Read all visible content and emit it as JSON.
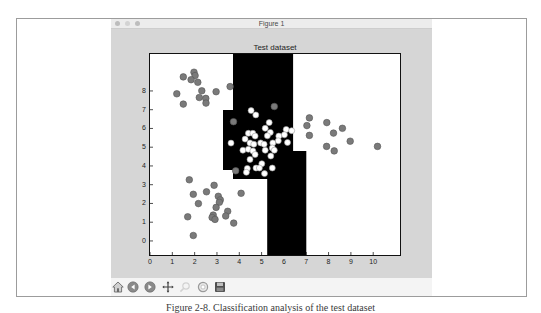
{
  "window": {
    "title": "Figure 1",
    "controls": [
      {
        "name": "close",
        "color": "#bdbdbd"
      },
      {
        "name": "minimize",
        "color": "#d3d3d3"
      },
      {
        "name": "zoom",
        "color": "#bdbdbd"
      }
    ],
    "canvas_color": "#d6d6d6"
  },
  "toolbar": {
    "buttons": [
      {
        "name": "home",
        "icon": "home-icon"
      },
      {
        "name": "back",
        "icon": "back-arrow-icon"
      },
      {
        "name": "forward",
        "icon": "forward-arrow-icon"
      },
      {
        "name": "pan",
        "icon": "pan-move-icon"
      },
      {
        "name": "zoom-to-rect",
        "icon": "zoom-magnifier-icon",
        "enabled": false
      },
      {
        "name": "configure-subplots",
        "icon": "subplots-icon"
      },
      {
        "name": "save",
        "icon": "save-icon"
      }
    ]
  },
  "caption": "Figure 2-8. Classification analysis of the test dataset",
  "chart_data": {
    "type": "scatter",
    "title": "Test dataset",
    "xlabel": "",
    "ylabel": "",
    "xlim": [
      0,
      11.2
    ],
    "ylim": [
      -0.75,
      9.97
    ],
    "xticks": [
      0,
      1,
      2,
      3,
      4,
      5,
      6,
      7,
      8,
      9,
      10
    ],
    "yticks": [
      0,
      1,
      2,
      3,
      4,
      5,
      6,
      7,
      8
    ],
    "grid": false,
    "legend": null,
    "background_region_color": "#ffffff",
    "decision_regions": [
      {
        "color": "#000000",
        "polygon": [
          [
            3.72,
            9.97
          ],
          [
            6.41,
            9.97
          ],
          [
            6.41,
            4.8
          ],
          [
            7.0,
            4.8
          ],
          [
            7.0,
            -0.75
          ],
          [
            5.25,
            -0.75
          ],
          [
            5.25,
            3.3
          ],
          [
            3.72,
            3.3
          ],
          [
            3.72,
            3.78
          ],
          [
            3.27,
            3.78
          ],
          [
            3.27,
            6.98
          ],
          [
            3.72,
            6.98
          ]
        ]
      }
    ],
    "series": [
      {
        "name": "gray points",
        "color": "#7a7a7a",
        "edge": "#555555",
        "points": [
          [
            1.49,
            8.75
          ],
          [
            1.97,
            9.0
          ],
          [
            2.02,
            8.82
          ],
          [
            1.84,
            8.6
          ],
          [
            2.14,
            8.46
          ],
          [
            2.32,
            8.01
          ],
          [
            1.2,
            7.85
          ],
          [
            2.96,
            7.96
          ],
          [
            2.21,
            7.65
          ],
          [
            2.5,
            7.6
          ],
          [
            2.51,
            7.35
          ],
          [
            1.49,
            7.3
          ],
          [
            3.59,
            8.23
          ],
          [
            5.57,
            7.17
          ],
          [
            3.74,
            6.36
          ],
          [
            3.84,
            3.74
          ],
          [
            1.76,
            3.26
          ],
          [
            2.87,
            2.97
          ],
          [
            1.94,
            2.49
          ],
          [
            2.53,
            2.62
          ],
          [
            3.06,
            2.38
          ],
          [
            3.15,
            2.19
          ],
          [
            3.11,
            2.06
          ],
          [
            2.17,
            1.99
          ],
          [
            4.08,
            2.54
          ],
          [
            2.96,
            1.79
          ],
          [
            3.48,
            1.58
          ],
          [
            3.39,
            1.33
          ],
          [
            2.83,
            1.38
          ],
          [
            2.78,
            1.25
          ],
          [
            2.91,
            1.15
          ],
          [
            1.69,
            1.29
          ],
          [
            3.75,
            0.95
          ],
          [
            1.94,
            0.29
          ],
          [
            7.14,
            6.56
          ],
          [
            7.03,
            6.15
          ],
          [
            7.92,
            6.31
          ],
          [
            8.22,
            5.75
          ],
          [
            8.62,
            6.01
          ],
          [
            7.14,
            5.63
          ],
          [
            8.97,
            5.32
          ],
          [
            7.91,
            5.04
          ],
          [
            8.25,
            4.8
          ],
          [
            10.19,
            5.04
          ]
        ]
      },
      {
        "name": "white points",
        "color": "#ffffff",
        "edge": "#9a9a9a",
        "points": [
          [
            4.53,
            6.95
          ],
          [
            4.74,
            6.72
          ],
          [
            5.34,
            6.31
          ],
          [
            5.16,
            6.01
          ],
          [
            5.39,
            5.79
          ],
          [
            4.41,
            5.74
          ],
          [
            4.61,
            5.74
          ],
          [
            4.71,
            5.59
          ],
          [
            5.26,
            5.61
          ],
          [
            6.1,
            5.95
          ],
          [
            6.35,
            5.88
          ],
          [
            6.02,
            5.66
          ],
          [
            5.77,
            5.59
          ],
          [
            4.26,
            5.43
          ],
          [
            4.48,
            5.23
          ],
          [
            4.65,
            5.16
          ],
          [
            4.96,
            5.23
          ],
          [
            5.11,
            5.16
          ],
          [
            5.5,
            5.23
          ],
          [
            5.75,
            5.34
          ],
          [
            6.16,
            5.25
          ],
          [
            3.63,
            5.22
          ],
          [
            4.16,
            4.84
          ],
          [
            4.41,
            4.89
          ],
          [
            4.61,
            4.8
          ],
          [
            5.16,
            4.84
          ],
          [
            5.48,
            4.96
          ],
          [
            5.57,
            4.84
          ],
          [
            4.71,
            4.61
          ],
          [
            5.41,
            4.53
          ],
          [
            4.48,
            4.35
          ],
          [
            5.01,
            4.12
          ],
          [
            4.75,
            3.89
          ],
          [
            4.9,
            3.89
          ],
          [
            4.36,
            3.87
          ],
          [
            5.48,
            3.89
          ],
          [
            4.32,
            3.66
          ],
          [
            5.13,
            3.59
          ]
        ]
      }
    ]
  }
}
